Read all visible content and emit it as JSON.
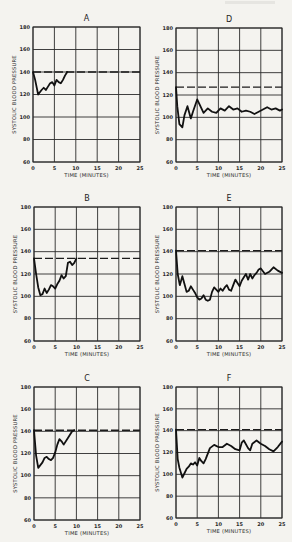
{
  "figure": {
    "xlabel": "TIME (MINUTES)",
    "ylabel": "SYSTOLIC BLOOD PRESSURE",
    "x_ticks": [
      "0",
      "5",
      "10",
      "15",
      "20",
      "25"
    ],
    "y_ticks": [
      "60",
      "80",
      "100",
      "120",
      "140",
      "160",
      "180"
    ]
  },
  "chart_data": [
    {
      "type": "line",
      "title": "A",
      "xlabel": "TIME (MINUTES)",
      "ylabel": "SYSTOLIC BLOOD PRESSURE",
      "xlim": [
        0,
        25
      ],
      "ylim": [
        60,
        180
      ],
      "grid": true,
      "baseline": {
        "style": "dashed",
        "y": 140
      },
      "series": [
        {
          "name": "Systolic BP",
          "x": [
            0,
            0.5,
            1.2,
            2,
            2.5,
            3,
            3.5,
            4,
            4.5,
            5,
            5.5,
            6,
            6.5,
            7,
            7.5,
            8
          ],
          "y": [
            140,
            133,
            120,
            124,
            126,
            124,
            127,
            130,
            131,
            128,
            133,
            131,
            130,
            133,
            137,
            140
          ]
        }
      ]
    },
    {
      "type": "line",
      "title": "B",
      "xlabel": "TIME (MINUTES)",
      "ylabel": "SYSTOLIC BLOOD PRESSURE",
      "xlim": [
        0,
        25
      ],
      "ylim": [
        60,
        180
      ],
      "grid": true,
      "baseline": {
        "style": "dashed",
        "y": 134
      },
      "series": [
        {
          "name": "Systolic BP",
          "x": [
            0,
            0.5,
            1,
            1.5,
            2,
            2.5,
            3,
            3.5,
            4,
            4.5,
            5,
            5.5,
            6,
            6.5,
            7,
            7.5,
            8,
            8.5,
            9,
            9.5,
            10
          ],
          "y": [
            134,
            120,
            108,
            101,
            102,
            107,
            103,
            106,
            110,
            109,
            107,
            111,
            114,
            119,
            116,
            118,
            130,
            131,
            128,
            130,
            134
          ]
        }
      ]
    },
    {
      "type": "line",
      "title": "C",
      "xlabel": "TIME (MINUTES)",
      "ylabel": "SYSTOLIC BLOOD PRESSURE",
      "xlim": [
        0,
        25
      ],
      "ylim": [
        60,
        180
      ],
      "grid": true,
      "baseline": {
        "style": "dashed",
        "y": 141
      },
      "series": [
        {
          "name": "Systolic BP",
          "x": [
            0,
            0.5,
            1,
            2,
            2.5,
            3,
            3.5,
            4,
            4.5,
            5,
            5.5,
            6,
            6.5,
            7,
            8,
            9,
            9.5
          ],
          "y": [
            141,
            118,
            107,
            112,
            116,
            117,
            115,
            114,
            116,
            121,
            128,
            133,
            131,
            128,
            134,
            140,
            141
          ]
        }
      ]
    },
    {
      "type": "line",
      "title": "D",
      "xlabel": "TIME (MINUTES)",
      "ylabel": "SYSTOLIC BLOOD PRESSURE",
      "xlim": [
        0,
        25
      ],
      "ylim": [
        60,
        180
      ],
      "grid": true,
      "baseline": {
        "style": "dashed",
        "y": 127
      },
      "series": [
        {
          "name": "Systolic BP",
          "x": [
            0,
            0.3,
            0.8,
            1.5,
            2,
            2.7,
            3.5,
            4,
            5,
            5.5,
            6.5,
            7.5,
            8.5,
            9.5,
            10.5,
            11.5,
            12.5,
            13.5,
            14.5,
            15.5,
            16.5,
            17.5,
            18.5,
            19.5,
            20.5,
            21.5,
            22.5,
            23.5,
            24.5,
            25
          ],
          "y": [
            127,
            110,
            94,
            91,
            102,
            110,
            99,
            105,
            116,
            112,
            104,
            108,
            105,
            104,
            108,
            106,
            110,
            107,
            108,
            105,
            106,
            105,
            103,
            105,
            107,
            109,
            107,
            108,
            106,
            107
          ]
        }
      ]
    },
    {
      "type": "line",
      "title": "E",
      "xlabel": "TIME (MINUTES)",
      "ylabel": "SYSTOLIC BLOOD PRESSURE",
      "xlim": [
        0,
        25
      ],
      "ylim": [
        60,
        180
      ],
      "grid": true,
      "baseline": {
        "style": "dashed",
        "y": 141
      },
      "series": [
        {
          "name": "Systolic BP",
          "x": [
            0,
            0.4,
            0.9,
            1.5,
            2,
            2.5,
            3,
            3.5,
            4,
            4.5,
            5,
            5.5,
            6,
            6.5,
            7,
            7.5,
            8,
            8.5,
            9,
            9.5,
            10,
            10.5,
            11,
            11.5,
            12,
            12.5,
            13,
            13.5,
            14,
            14.5,
            15,
            15.5,
            16,
            16.5,
            17,
            17.5,
            18,
            18.5,
            19,
            19.5,
            20,
            21,
            22,
            23,
            24,
            25
          ],
          "y": [
            141,
            120,
            110,
            118,
            111,
            104,
            105,
            109,
            106,
            103,
            99,
            97,
            98,
            101,
            97,
            96,
            97,
            104,
            108,
            106,
            104,
            107,
            105,
            108,
            110,
            106,
            105,
            110,
            115,
            112,
            109,
            114,
            117,
            120,
            115,
            120,
            116,
            119,
            121,
            124,
            125,
            120,
            122,
            126,
            123,
            121
          ]
        }
      ]
    },
    {
      "type": "line",
      "title": "F",
      "xlabel": "TIME (MINUTES)",
      "ylabel": "SYSTOLIC BLOOD PRESSURE",
      "xlim": [
        0,
        25
      ],
      "ylim": [
        60,
        180
      ],
      "grid": true,
      "baseline": {
        "style": "dashed",
        "y": 141
      },
      "series": [
        {
          "name": "Systolic BP",
          "x": [
            0,
            0.4,
            0.8,
            1.5,
            2,
            2.5,
            3,
            3.5,
            4,
            4.5,
            5,
            5.5,
            6,
            6.5,
            7,
            8,
            9,
            10,
            11,
            12,
            13,
            14,
            15,
            15.5,
            16,
            17,
            17.5,
            18,
            19,
            20,
            21,
            22,
            23,
            24,
            25
          ],
          "y": [
            141,
            114,
            106,
            97,
            101,
            105,
            107,
            110,
            109,
            111,
            108,
            115,
            112,
            110,
            114,
            124,
            127,
            125,
            125,
            128,
            126,
            123,
            122,
            129,
            131,
            124,
            122,
            128,
            131,
            128,
            126,
            123,
            121,
            125,
            130
          ]
        }
      ]
    }
  ]
}
